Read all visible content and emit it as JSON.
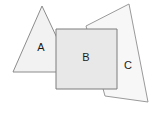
{
  "figure": {
    "name": "overlapping-shapes-diagram",
    "width": 156,
    "height": 113,
    "background_color": "#ffffff"
  },
  "chart_data": {
    "type": "diagram",
    "title": "",
    "xlabel": "",
    "ylabel": "",
    "shapes": [
      {
        "id": "A",
        "label": "A",
        "kind": "triangle",
        "points": "42,6 73,72 13,72",
        "fill": "#f2f2f2",
        "stroke": "#8c8c8c",
        "stroke_width": 1,
        "label_x": 41,
        "label_y": 48
      },
      {
        "id": "C",
        "label": "C",
        "kind": "quadrilateral",
        "points": "129,4 148,102 105,96 86,26",
        "fill": "#f7f7f7",
        "stroke": "#9a9a9a",
        "stroke_width": 1,
        "label_x": 128,
        "label_y": 66
      },
      {
        "id": "B",
        "label": "B",
        "kind": "square",
        "points": "56,29 117,29 117,89 56,89",
        "fill": "#e8e8e8",
        "stroke": "#7d7d7d",
        "stroke_width": 1,
        "label_x": 86,
        "label_y": 58
      }
    ],
    "labels": [
      "A",
      "B",
      "C"
    ],
    "legend": [],
    "grid": false
  }
}
